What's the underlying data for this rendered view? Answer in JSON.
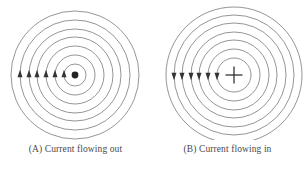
{
  "figure": {
    "background_color": "#ffffff",
    "width": 303,
    "height": 171
  },
  "style": {
    "ring_stroke_color": "#7a7a7a",
    "ring_stroke_width": 0.8,
    "marker_color": "#333333",
    "symbol_color": "#222222",
    "caption_color": "#4a4a4a"
  },
  "panels": [
    {
      "id": "A",
      "label": "(A)",
      "caption": "(A) Current flowing out",
      "center": {
        "x": 75,
        "y": 75
      },
      "current_direction": "out-of-page",
      "center_symbol": "dot",
      "center_symbol_name": "current-out-dot-icon",
      "field_ring_radii": [
        11,
        20,
        29,
        38,
        46,
        55,
        64
      ],
      "ring_count": 7,
      "arrow_direction": "up",
      "arrow_marker_name": "field-direction-arrow-up-icon",
      "arrow_count": 6,
      "arrow_positions_x": [
        11,
        20,
        29,
        38,
        46,
        55
      ],
      "arrow_axis_y": 75,
      "field_sense": "counterclockwise"
    },
    {
      "id": "B",
      "label": "(B)",
      "caption": "(B) Current flowing in",
      "center": {
        "x": 82,
        "y": 75
      },
      "current_direction": "into-page",
      "center_symbol": "cross",
      "center_symbol_name": "current-in-cross-icon",
      "field_ring_radii": [
        17,
        26,
        35,
        43,
        52,
        60,
        68
      ],
      "ring_count": 7,
      "arrow_direction": "down",
      "arrow_marker_name": "field-direction-arrow-down-icon",
      "arrow_count": 6,
      "arrow_positions_x": [
        17,
        26,
        35,
        43,
        52,
        60
      ],
      "arrow_axis_y": 75,
      "field_sense": "clockwise"
    }
  ]
}
